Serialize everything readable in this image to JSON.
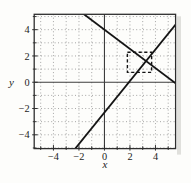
{
  "chart_data": {
    "type": "line",
    "title": "",
    "xlabel": "x",
    "ylabel": "y",
    "xlim": [
      -5.51,
      5.58
    ],
    "ylim": [
      -5.05,
      5.17
    ],
    "x_major_ticks": [
      -4,
      -2,
      0,
      2,
      4
    ],
    "x_major_tick_labels": [
      "−4",
      "−2",
      "0",
      "2",
      "4"
    ],
    "x_minor_ticks": [
      -5,
      -3,
      -1,
      1,
      3,
      5
    ],
    "y_major_ticks": [
      -4,
      -2,
      0,
      2,
      4
    ],
    "y_major_tick_labels": [
      "−4",
      "−2",
      "0",
      "2",
      "4"
    ],
    "y_minor_ticks": [
      -5,
      -3,
      -1,
      1,
      3,
      5
    ],
    "grid": {
      "show": true,
      "style": "dotted",
      "positions": [
        -5,
        -4,
        -3,
        -2,
        -1,
        1,
        2,
        3,
        4,
        5
      ]
    },
    "zero_axes": true,
    "series": [
      {
        "name": "increasing-line",
        "kind": "linear",
        "slope": 1.2,
        "intercept": -2.3,
        "x_intercept": 1.92,
        "points": [
          [
            -2.29,
            -5.05
          ],
          [
            5.58,
            4.4
          ]
        ]
      },
      {
        "name": "decreasing-line",
        "kind": "linear",
        "slope": -0.73,
        "intercept": 4.0,
        "x_intercept": 5.48,
        "points": [
          [
            -1.6,
            5.17
          ],
          [
            5.58,
            -0.07
          ]
        ]
      }
    ],
    "intersection_approx": {
      "x": 3.26,
      "y": 1.62
    },
    "annotations": [
      {
        "type": "dashed-rect",
        "name": "zoom-box",
        "x1": 1.8,
        "x2": 3.7,
        "y1": 0.75,
        "y2": 2.28
      }
    ],
    "colors": {
      "background": "#fdfdfb",
      "frame": "#2e2e2e",
      "grid": "#8f8f8f",
      "zero_axis": "#3c3c3c",
      "line": "#141414",
      "text": "#1c1c1c",
      "scan_shadow": "#c8c8c2"
    }
  }
}
